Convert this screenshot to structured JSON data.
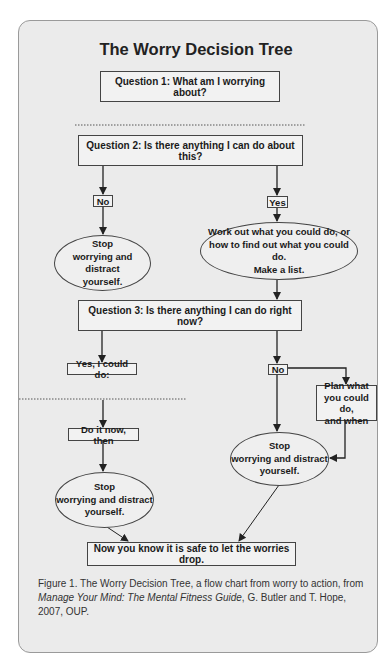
{
  "title": "The Worry Decision Tree",
  "nodes": {
    "q1": "Question 1: What am I worrying about?",
    "q2": "Question 2: Is there anything I can do about this?",
    "q2_no": "No",
    "q2_yes": "Yes",
    "stop_1": [
      "Stop",
      "worrying and distract",
      "yourself."
    ],
    "work_out": [
      "Work out what you could do, or",
      "how to find out what you could do.",
      "Make a list."
    ],
    "q3": "Question 3: Is there anything I can do right now?",
    "q3_yes": "Yes, I could do:",
    "q3_no": "No",
    "plan": [
      "Plan what",
      "you could do,",
      "and when"
    ],
    "do_it_now": "Do it now, then",
    "stop_2": [
      "Stop",
      "worrying and distract",
      "yourself."
    ],
    "stop_3": [
      "Stop",
      "worrying and distract",
      "yourself."
    ],
    "final": "Now you know it is safe to let the worries drop."
  },
  "caption": {
    "prefix": "Figure 1.  The Worry Decision Tree, a flow chart from worry to action, from ",
    "book_title": "Manage Your Mind: The Mental Fitness Guide",
    "suffix": ", G. Butler and T. Hope, 2007, OUP."
  },
  "colors": {
    "panel_background": "#ebebeb",
    "panel_border": "#9a9a9a",
    "line": "#222222"
  }
}
